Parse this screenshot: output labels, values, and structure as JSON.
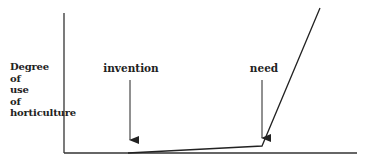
{
  "diagram": {
    "y_axis_label_lines": [
      "Degree",
      "of",
      "use",
      "of",
      "horticulture"
    ],
    "markers": [
      {
        "label": "invention",
        "x": 130
      },
      {
        "label": "need",
        "x": 262
      }
    ],
    "curve_description": "flat near zero from invention, slight rise to need, then steep rise",
    "line_color": "#222222"
  }
}
